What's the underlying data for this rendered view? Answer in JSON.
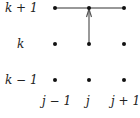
{
  "diagram": {
    "row_labels": [
      "k + 1",
      "k",
      "k − 1"
    ],
    "col_labels": [
      "j − 1",
      "j",
      "j + 1"
    ],
    "grid": {
      "cols_x": [
        55,
        89,
        124
      ],
      "rows_y": [
        8,
        44,
        80
      ]
    },
    "edges": [
      {
        "from": "j-1,k+1",
        "to": "j+1,k+1",
        "type": "line"
      },
      {
        "from": "j,k",
        "to": "j,k+1",
        "type": "arrow"
      }
    ],
    "colors": {
      "dot": "#111111",
      "line": "#333333",
      "arrow": "#555555"
    }
  }
}
